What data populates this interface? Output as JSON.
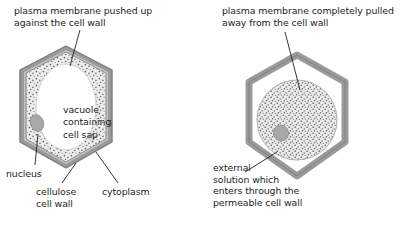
{
  "diagram": {
    "type": "biology-cell-diagram",
    "background_color": "#ffffff",
    "text_color": "#231f20",
    "wall_color": "#9a9a9a",
    "wall_edge_color": "#7d7d7d",
    "wall_inner_color": "#c9c9c9",
    "cytoplasm_color": "#e9e9e9",
    "stipple_color": "#6f6f6f",
    "vacuole_color": "#ffffff",
    "nucleus_color": "#a8a8a8",
    "leader_color": "#231f20"
  },
  "panels": {
    "left": {
      "name": "turgid-cell",
      "caption": "plasma membrane pushed up\nagainst the cell wall",
      "vacuole_label": "vacuole\ncontaining\ncell sap",
      "labels": {
        "nucleus": "nucleus",
        "cell_wall": "cellulose\ncell wall",
        "cytoplasm": "cytoplasm"
      }
    },
    "right": {
      "name": "plasmolysed-cell",
      "caption": "plasma membrane completely pulled\naway from the cell wall",
      "labels": {
        "external_solution": "external\nsolution which\nenters through the\npermeable cell wall"
      }
    }
  }
}
